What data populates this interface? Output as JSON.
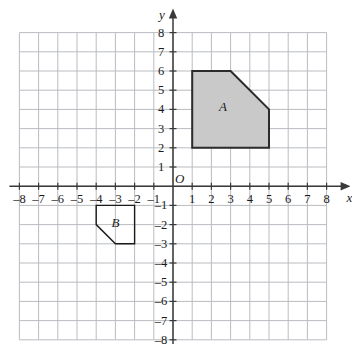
{
  "figure": {
    "type": "coordinate-grid-diagram",
    "background_color": "#ffffff",
    "grid_line_color": "#b9bcc0",
    "axis_color": "#3a3a3a",
    "origin_label": "O",
    "x_axis": {
      "label": "x",
      "min": -8,
      "max": 8,
      "tick_labels": [
        "–8",
        "–7",
        "–6",
        "–5",
        "–4",
        "–3",
        "–2",
        "–1",
        "1",
        "2",
        "3",
        "4",
        "5",
        "6",
        "7",
        "8"
      ],
      "tick_values": [
        -8,
        -7,
        -6,
        -5,
        -4,
        -3,
        -2,
        -1,
        1,
        2,
        3,
        4,
        5,
        6,
        7,
        8
      ],
      "arrowhead": true
    },
    "y_axis": {
      "label": "y",
      "min": -8,
      "max": 8,
      "tick_labels": [
        "8",
        "7",
        "6",
        "5",
        "4",
        "3",
        "2",
        "1",
        "–1",
        "–2",
        "–3",
        "–4",
        "–5",
        "–6",
        "–7",
        "–8"
      ],
      "tick_values": [
        8,
        7,
        6,
        5,
        4,
        3,
        2,
        1,
        -1,
        -2,
        -3,
        -4,
        -5,
        -6,
        -7,
        -8
      ],
      "arrowhead": true
    }
  },
  "chart_data": {
    "type": "scatter",
    "title": "",
    "xlabel": "x",
    "ylabel": "y",
    "xlim": [
      -8,
      8
    ],
    "ylim": [
      -8,
      8
    ],
    "grid": true,
    "legend": "none",
    "shapes": [
      {
        "label": "A",
        "kind": "pentagon",
        "vertices": [
          [
            1,
            2
          ],
          [
            1,
            6
          ],
          [
            3,
            6
          ],
          [
            5,
            4
          ],
          [
            5,
            2
          ]
        ],
        "fill_color": "#c9c9c9",
        "stroke_color": "#2b2b2b",
        "stroke_width": 2,
        "filled": true,
        "label_position": [
          2.6,
          4.2
        ]
      },
      {
        "label": "B",
        "kind": "pentagon",
        "vertices": [
          [
            -4,
            -1
          ],
          [
            -2,
            -1
          ],
          [
            -2,
            -3
          ],
          [
            -3,
            -3
          ],
          [
            -4,
            -2
          ]
        ],
        "fill_color": "#ffffff",
        "stroke_color": "#1a1a1a",
        "stroke_width": 1.4,
        "filled": false,
        "label_position": [
          -3.0,
          -1.85
        ]
      }
    ]
  }
}
